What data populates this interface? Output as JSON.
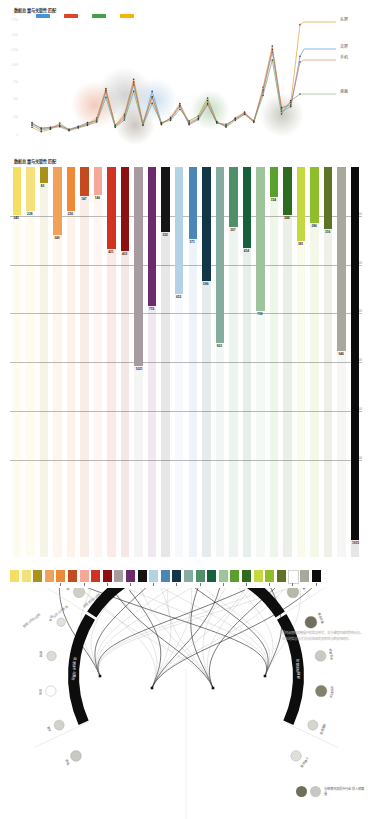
{
  "line_chart": {
    "title": "数据总量与关联性匹配",
    "legend": [
      {
        "name": "blue-series",
        "color": "#4a90d9"
      },
      {
        "name": "red-series",
        "color": "#e0422c"
      },
      {
        "name": "green-series",
        "color": "#43a047"
      },
      {
        "name": "yellow-series",
        "color": "#f2b705"
      }
    ],
    "end_labels": [
      {
        "label": "头屏",
        "color": "#d9a441",
        "y": 22
      },
      {
        "label": "次屏",
        "color": "#5b9bd5",
        "y": 49
      },
      {
        "label": "手机",
        "color": "#d98f6e",
        "y": 60
      },
      {
        "label": "桌面",
        "color": "#8fbc8f",
        "y": 94
      }
    ],
    "y_ticks": [
      "1750",
      "1500",
      "1250",
      "1000",
      "750",
      "500",
      "250",
      "0"
    ]
  },
  "chart_data": [
    {
      "type": "line",
      "title": "数据总量与关联性匹配",
      "xlabel": "",
      "ylabel": "",
      "ylim": [
        0,
        1800
      ],
      "grid": false,
      "legend_position": "top-left",
      "x": [
        1,
        2,
        3,
        4,
        5,
        6,
        7,
        8,
        9,
        10,
        11,
        12,
        13,
        14,
        15,
        16,
        17,
        18,
        19,
        20,
        21,
        22,
        23,
        24,
        25,
        26,
        27,
        28,
        29,
        30
      ],
      "series": [
        {
          "name": "头屏",
          "color": "#e0a23c",
          "values": [
            160,
            95,
            130,
            225,
            120,
            165,
            210,
            300,
            740,
            195,
            355,
            880,
            225,
            600,
            200,
            310,
            515,
            235,
            300,
            560,
            240,
            170,
            300,
            390,
            245,
            760,
            1380,
            430,
            530,
            1700
          ]
        },
        {
          "name": "次屏",
          "color": "#5b9bd5",
          "values": [
            230,
            140,
            155,
            195,
            130,
            175,
            230,
            255,
            690,
            175,
            300,
            800,
            205,
            700,
            230,
            285,
            470,
            200,
            275,
            500,
            225,
            205,
            280,
            360,
            260,
            690,
            1290,
            400,
            470,
            1225
          ]
        },
        {
          "name": "手机",
          "color": "#d9694e",
          "values": [
            210,
            150,
            160,
            185,
            125,
            160,
            205,
            270,
            715,
            185,
            330,
            840,
            200,
            620,
            215,
            295,
            490,
            215,
            290,
            520,
            230,
            190,
            290,
            375,
            250,
            720,
            1330,
            455,
            495,
            1140
          ]
        },
        {
          "name": "桌面",
          "color": "#6ea66e",
          "values": [
            190,
            120,
            145,
            170,
            110,
            150,
            190,
            240,
            610,
            160,
            270,
            700,
            190,
            520,
            225,
            265,
            430,
            255,
            330,
            600,
            245,
            165,
            265,
            355,
            235,
            640,
            1170,
            360,
            560,
            660
          ]
        }
      ]
    },
    {
      "type": "bar",
      "title": "数据总量与关联性匹配",
      "ylabel": "",
      "ylim": [
        0,
        1700
      ],
      "grid": true,
      "gridlines": [
        250,
        500,
        750,
        1000,
        1250,
        1500
      ],
      "categories": [
        "c1",
        "c2",
        "c3",
        "c4",
        "c5",
        "c6",
        "c7",
        "c8",
        "c9",
        "c10",
        "c11",
        "c12",
        "c13",
        "c14",
        "c15",
        "c16",
        "c17",
        "c18",
        "c19",
        "c20",
        "c21",
        "c22",
        "c23",
        "c24",
        "c25",
        "c26",
        "c27",
        "c28",
        "c29",
        "c30",
        "c31"
      ],
      "values": [
        245,
        228,
        83,
        349,
        226,
        147,
        146,
        0,
        421,
        433,
        715,
        1021,
        332,
        652,
        371,
        366,
        386,
        307,
        414,
        154,
        739,
        244,
        286,
        316,
        381,
        0,
        0,
        946,
        0,
        0,
        1915
      ],
      "bars": [
        {
          "value": 245,
          "color": "#f4df63",
          "label": "245"
        },
        {
          "value": 228,
          "color": "#f5e07a",
          "label": "228"
        },
        {
          "value": 83,
          "color": "#a89218",
          "label": "83"
        },
        {
          "value": 349,
          "color": "#f0a25a",
          "label": "349"
        },
        {
          "value": 226,
          "color": "#ef8936",
          "label": "226"
        },
        {
          "value": 147,
          "color": "#c44a20",
          "label": "147"
        },
        {
          "value": 146,
          "color": "#f4a898",
          "label": "146"
        },
        {
          "value": 421,
          "color": "#d0331f",
          "label": "421"
        },
        {
          "value": 433,
          "color": "#8d1110",
          "label": "433"
        },
        {
          "value": 1021,
          "color": "#a79aa0",
          "label": "1021"
        },
        {
          "value": 715,
          "color": "#6d2b6b",
          "label": "715"
        },
        {
          "value": 332,
          "color": "#151515",
          "label": "332"
        },
        {
          "value": 652,
          "color": "#b4d2e6",
          "label": "652"
        },
        {
          "value": 371,
          "color": "#4a87b8",
          "label": "371"
        },
        {
          "value": 586,
          "color": "#123747",
          "label": "586"
        },
        {
          "value": 903,
          "color": "#84ada0",
          "label": "903"
        },
        {
          "value": 307,
          "color": "#4f8f6c",
          "label": "307"
        },
        {
          "value": 414,
          "color": "#16603b",
          "label": "414"
        },
        {
          "value": 739,
          "color": "#9dc49a",
          "label": "739"
        },
        {
          "value": 154,
          "color": "#5aa02c",
          "label": "154"
        },
        {
          "value": 244,
          "color": "#2f6b1e",
          "label": "244"
        },
        {
          "value": 381,
          "color": "#c3d93f",
          "label": "381"
        },
        {
          "value": 286,
          "color": "#8ebe29",
          "label": "286"
        },
        {
          "value": 316,
          "color": "#5f7327",
          "label": "316"
        },
        {
          "value": 946,
          "color": "#a8a89c",
          "label": "946"
        },
        {
          "value": 1915,
          "color": "#0b0b0b",
          "label": "1915"
        }
      ]
    }
  ],
  "bar_chart": {
    "title": "数据总量与关联性匹配",
    "axis_labels": [
      "250",
      "500",
      "750",
      "1000",
      "1250",
      "1500"
    ]
  },
  "palette": {
    "swatches": [
      "#f4df63",
      "#f5e07a",
      "#a89218",
      "#f0a25a",
      "#ef8936",
      "#c44a20",
      "#f4a898",
      "#d0331f",
      "#8d1110",
      "#a79aa0",
      "#6d2b6b",
      "#151515",
      "#b4d2e6",
      "#4a87b8",
      "#123747",
      "#84ada0",
      "#4f8f6c",
      "#16603b",
      "#9dc49a",
      "#5aa02c",
      "#2f6b1e",
      "#c3d93f",
      "#8ebe29",
      "#5f7327",
      "#ffffff",
      "#a8a89c",
      "#0b0b0b"
    ]
  },
  "chord": {
    "note": "围绕调查结果数据中的信息技术，关于课程内容的影响分析。在主题信息与方法分析结果的关联性与相关性研究。",
    "arcs": [
      {
        "label": "信息技术与整合",
        "name": "arc-segment-1"
      },
      {
        "label": "数字化教育方案",
        "name": "arc-segment-2"
      },
      {
        "label": "教学资源数据库",
        "name": "arc-segment-3"
      },
      {
        "label": "课程体系建设",
        "name": "arc-segment-4"
      }
    ],
    "outer_labels": [
      "数据分析与应用",
      "信息化与教育",
      "课程建设与管理"
    ],
    "nodes": [
      {
        "label": "课程",
        "fill": "#c9c9c4",
        "r": 5.4
      },
      {
        "label": "教学",
        "fill": "#d2d2cc",
        "r": 5.0
      },
      {
        "label": "资源",
        "fill": "#ffffff",
        "r": 5.2
      },
      {
        "label": "数据",
        "fill": "#dcdcd6",
        "r": 4.8
      },
      {
        "label": "技术",
        "fill": "#e2e2dc",
        "r": 4.2
      },
      {
        "label": "平台应用",
        "fill": "#cfcfc8",
        "r": 5.6
      },
      {
        "label": "教育信息",
        "fill": "#dadad4",
        "r": 5.2
      },
      {
        "label": "学习系统",
        "fill": "#e4e4de",
        "r": 5.4
      },
      {
        "label": "评价体系",
        "fill": "#f0f0ec",
        "r": 5.8
      },
      {
        "label": "数字资源",
        "fill": "#9a9a86",
        "r": 6.2
      },
      {
        "label": "网络教学",
        "fill": "#d4d4ce",
        "r": 5.4
      },
      {
        "label": "智慧课堂",
        "fill": "#a9a995",
        "r": 6.0
      },
      {
        "label": "质量监控",
        "fill": "#b8b8a8",
        "r": 5.8
      },
      {
        "label": "教师发展",
        "fill": "#6f6f5a",
        "r": 6.0
      },
      {
        "label": "学生素养",
        "fill": "#cacac2",
        "r": 5.4
      },
      {
        "label": "实践创新",
        "fill": "#81816c",
        "r": 5.8
      },
      {
        "label": "管理服务",
        "fill": "#d6d6d0",
        "r": 5.0
      },
      {
        "label": "协同育人",
        "fill": "#e0e0da",
        "r": 5.2
      }
    ],
    "legend": {
      "dark_color": "#6f6f5a",
      "light_color": "#c8c8c2",
      "text": "分布情况及提升行业\n投入预算量"
    }
  }
}
